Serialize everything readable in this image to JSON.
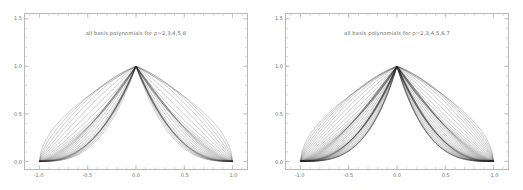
{
  "figure": {
    "background": "#ffffff",
    "frame_color": "#b9b9b9",
    "curve_color": "#2b2b2b",
    "text_color": "#6a6a6a"
  },
  "chart_data": [
    {
      "type": "line",
      "title": "all basis polynomials for p=2,3,4,5,6",
      "xlabel": "",
      "ylabel": "",
      "xlim": [
        -1.15,
        1.15
      ],
      "ylim": [
        -0.08,
        1.55
      ],
      "xticks": [
        -1.0,
        -0.5,
        0.0,
        0.5,
        1.0
      ],
      "xticklabels": [
        "-1.0",
        "-0.5",
        "0.0",
        "0.5",
        "1.0"
      ],
      "yticks": [
        0.0,
        0.5,
        1.0,
        1.5
      ],
      "yticklabels": [
        "0.0",
        "0.5",
        "1.0",
        "1.5"
      ],
      "grid": false,
      "legend": "none",
      "minor_ticks": true,
      "degrees": [
        2,
        3,
        4,
        5,
        6
      ],
      "description": "Dense family of hierarchical/Lobatto-type basis polynomials on [-1,1]; every curve is 0 at x=-1 and x=+1 and reaches 1.0 at x=0, forming two mirrored lobes meeting at (0,1).",
      "anchor_points": {
        "left_root": [
          -1.0,
          0.0
        ],
        "peak": [
          0.0,
          1.0
        ],
        "right_root": [
          1.0,
          0.0
        ]
      },
      "curve_count": 26
    },
    {
      "type": "line",
      "title": "all basis polynomials for p=2,3,4,5,6,7",
      "xlabel": "",
      "ylabel": "",
      "xlim": [
        -1.15,
        1.15
      ],
      "ylim": [
        -0.08,
        1.55
      ],
      "xticks": [
        -1.0,
        -0.5,
        0.0,
        0.5,
        1.0
      ],
      "xticklabels": [
        "-1.0",
        "-0.5",
        "0.0",
        "0.5",
        "1.0"
      ],
      "yticks": [
        0.0,
        0.5,
        1.0,
        1.5
      ],
      "yticklabels": [
        "0.0",
        "0.5",
        "1.0",
        "1.5"
      ],
      "grid": false,
      "legend": "none",
      "minor_ticks": true,
      "degrees": [
        2,
        3,
        4,
        5,
        6,
        7
      ],
      "description": "Same basis family extended to degree 7; denser and visually darker band, broader lobes than the left panel.",
      "anchor_points": {
        "left_root": [
          -1.0,
          0.0
        ],
        "peak": [
          0.0,
          1.0
        ],
        "right_root": [
          1.0,
          0.0
        ]
      },
      "curve_count": 40
    }
  ]
}
